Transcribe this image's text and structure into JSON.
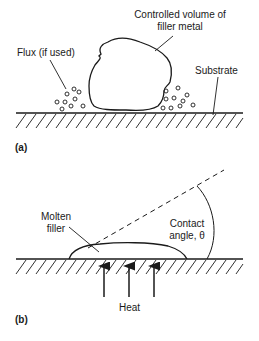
{
  "figure": {
    "panel_a": {
      "label": "(a)",
      "filler_label_line1": "Controlled volume of",
      "filler_label_line2": "filler metal",
      "flux_label": "Flux (if used)",
      "substrate_label": "Substrate"
    },
    "panel_b": {
      "label": "(b)",
      "molten_label_line1": "Molten",
      "molten_label_line2": "filler",
      "contact_label_line1": "Contact",
      "contact_label_line2": "angle, θ",
      "heat_label": "Heat"
    },
    "colors": {
      "ink": "#1a1a1a",
      "background": "#ffffff"
    }
  }
}
